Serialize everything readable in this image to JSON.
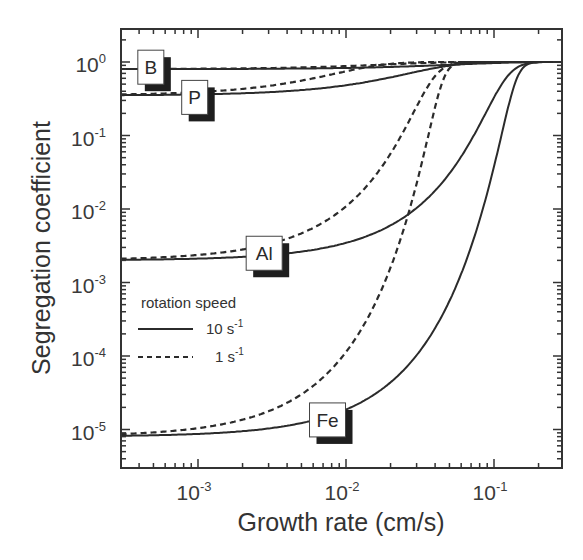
{
  "chart_data": {
    "type": "line",
    "title": "",
    "xlabel": "Growth rate (cm/s)",
    "ylabel": "Segregation coefficient",
    "xscale": "log",
    "yscale": "log",
    "xlim": [
      0.0003,
      0.35
    ],
    "ylim": [
      1.7e-06,
      2.9
    ],
    "grid": false,
    "x_ticks": [
      {
        "base": "10",
        "exp": "-3",
        "value": 0.001
      },
      {
        "base": "10",
        "exp": "-2",
        "value": 0.01
      },
      {
        "base": "10",
        "exp": "-1",
        "value": 0.1
      }
    ],
    "y_ticks": [
      {
        "base": "10",
        "exp": "0",
        "value": 1
      },
      {
        "base": "10",
        "exp": "-1",
        "value": 0.1
      },
      {
        "base": "10",
        "exp": "-2",
        "value": 0.01
      },
      {
        "base": "10",
        "exp": "-3",
        "value": 0.001
      },
      {
        "base": "10",
        "exp": "-4",
        "value": 0.0001
      },
      {
        "base": "10",
        "exp": "-5",
        "value": 1e-05
      }
    ],
    "legend": {
      "title": "rotation speed",
      "position": "lower-left inside",
      "entries": [
        {
          "label": "10 s",
          "sup": "-1",
          "style": "solid"
        },
        {
          "label": "1 s",
          "sup": "-1",
          "style": "dashed"
        }
      ]
    },
    "model": "k_eff = k0 / (k0 + (1 - k0) * exp(-v * delta_over_D))",
    "series": [
      {
        "element": "B",
        "rotation": "10 s-1",
        "style": "solid",
        "k0": 0.8,
        "delta_over_D": 20
      },
      {
        "element": "B",
        "rotation": "1 s-1",
        "style": "dashed",
        "k0": 0.8,
        "delta_over_D": 60
      },
      {
        "element": "P",
        "rotation": "10 s-1",
        "style": "solid",
        "k0": 0.35,
        "delta_over_D": 55
      },
      {
        "element": "P",
        "rotation": "1 s-1",
        "style": "dashed",
        "k0": 0.35,
        "delta_over_D": 170
      },
      {
        "element": "Al",
        "rotation": "10 s-1",
        "style": "solid",
        "k0": 0.002,
        "delta_over_D": 55
      },
      {
        "element": "Al",
        "rotation": "1 s-1",
        "style": "dashed",
        "k0": 0.002,
        "delta_over_D": 170
      },
      {
        "element": "Fe",
        "rotation": "10 s-1",
        "style": "solid",
        "k0": 8e-06,
        "delta_over_D": 85
      },
      {
        "element": "Fe",
        "rotation": "1 s-1",
        "style": "dashed",
        "k0": 8e-06,
        "delta_over_D": 265
      }
    ],
    "annotations": [
      {
        "text": "B",
        "x": 0.00048,
        "y": 0.85
      },
      {
        "text": "P",
        "x": 0.00095,
        "y": 0.33
      },
      {
        "text": "Al",
        "x": 0.0028,
        "y": 0.0025
      },
      {
        "text": "Fe",
        "x": 0.0075,
        "y": 1.35e-05
      }
    ]
  }
}
